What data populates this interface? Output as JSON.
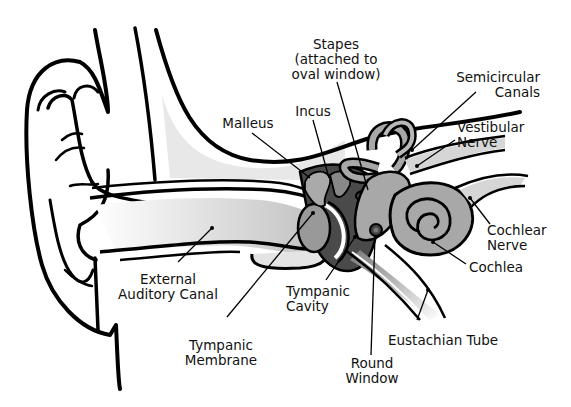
{
  "diagram": {
    "colors": {
      "outline": "#000000",
      "light_fill": "#e6e6e6",
      "mid_fill": "#a8a8a8",
      "dark_fill": "#4a4a4a",
      "background": "#ffffff"
    },
    "labels": {
      "stapes": {
        "line1": "Stapes",
        "line2": "(attached to",
        "line3": "oval window)"
      },
      "incus": {
        "line1": "Incus"
      },
      "malleus": {
        "line1": "Malleus"
      },
      "semicircular_canals": {
        "line1": "Semicircular",
        "line2": "Canals"
      },
      "vestibular_nerve": {
        "line1": "Vestibular",
        "line2": "Nerve"
      },
      "cochlear_nerve": {
        "line1": "Cochlear",
        "line2": "Nerve"
      },
      "cochlea": {
        "line1": "Cochlea"
      },
      "external_auditory_canal": {
        "line1": "External",
        "line2": "Auditory Canal"
      },
      "tympanic_cavity": {
        "line1": "Tympanic",
        "line2": "Cavity"
      },
      "tympanic_membrane": {
        "line1": "Tympanic",
        "line2": "Membrane"
      },
      "eustachian_tube": {
        "line1": "Eustachian Tube"
      },
      "round_window": {
        "line1": "Round",
        "line2": "Window"
      }
    }
  }
}
